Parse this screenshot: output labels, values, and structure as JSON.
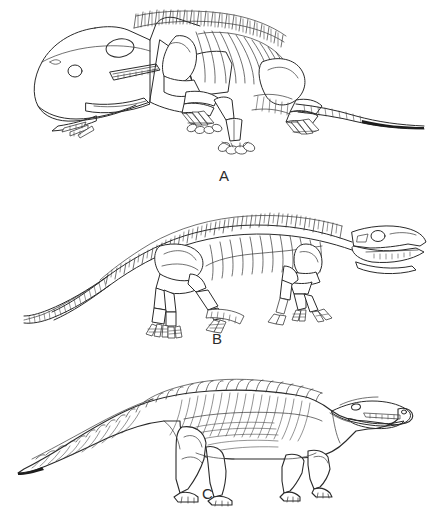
{
  "figure": {
    "background_color": "#ffffff",
    "ink_color": "#2a2a2a",
    "width": 433,
    "height": 511,
    "panel_count": 3
  },
  "panels": [
    {
      "label": "A",
      "subject": "sprawling-posture-skeleton",
      "description": "Lateral view skeletal reconstruction of a sprawling quadrupedal reptile with broad low skull, dorsal neural spines, ribs, and long tapering tail",
      "features": [
        "broad-triangular-skull",
        "orbit-eye-socket",
        "naris-nostril",
        "tooth-row",
        "cervical-vertebrae",
        "dorsal-neural-spines",
        "rib-cage",
        "scapula-shoulder-girdle",
        "humerus",
        "radius-ulna",
        "manus-hand-digits",
        "pelvis-ilium",
        "femur",
        "tibia-fibula",
        "pes-foot-digits",
        "caudal-vertebrae-tail"
      ]
    },
    {
      "label": "B",
      "subject": "erect-posture-skeleton",
      "description": "Lateral view skeletal reconstruction of an erect-limbed archosaur with elongate skull, segmented vertebral column and long curving tail",
      "features": [
        "elongate-skull",
        "antorbital-fenestra",
        "orbit-eye-socket",
        "tooth-row-jaw",
        "cervical-vertebrae",
        "dorsal-vertebrae-neural-spines",
        "rib-cage",
        "scapula-coracoid",
        "humerus",
        "radius-ulna",
        "manus-hand-digits",
        "pelvis-ilium",
        "femur",
        "tibia-fibula",
        "pes-foot-digits",
        "caudal-vertebrae-tail"
      ]
    },
    {
      "label": "C",
      "subject": "flesh-reconstruction",
      "description": "Lateral view life restoration of an armored crocodile-like quadruped with dorsal osteoderm scutes, hatched flank shading and long tapering tail",
      "features": [
        "crocodilian-snout",
        "eye",
        "nostril",
        "tooth-row",
        "dorsal-osteoderm-scutes",
        "flank-hatching",
        "forelimb",
        "hindlimb",
        "manus-clawed-foot",
        "pes-clawed-foot",
        "tapering-tail"
      ]
    }
  ],
  "labels": {
    "a": "A",
    "b": "B",
    "c": "C"
  }
}
